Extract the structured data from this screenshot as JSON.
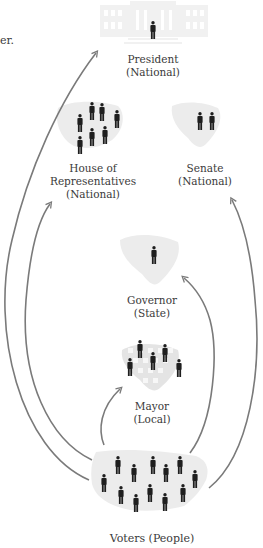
{
  "diagram": {
    "fragment_text": "er.",
    "nodes": {
      "president": {
        "title": "President",
        "scope": "(National)",
        "people": 1
      },
      "house": {
        "title_line1": "House of",
        "title_line2": "Representatives",
        "scope": "(National)",
        "people": 7
      },
      "senate": {
        "title": "Senate",
        "scope": "(National)",
        "people": 2
      },
      "governor": {
        "title": "Governor",
        "scope": "(State)",
        "people": 1
      },
      "mayor": {
        "title": "Mayor",
        "scope": "(Local)",
        "people": 5
      },
      "voters": {
        "title": "Voters (People)",
        "people": 14
      }
    },
    "edges": [
      {
        "from": "voters",
        "to": "president"
      },
      {
        "from": "voters",
        "to": "house"
      },
      {
        "from": "voters",
        "to": "senate"
      },
      {
        "from": "voters",
        "to": "governor"
      },
      {
        "from": "voters",
        "to": "mayor"
      }
    ],
    "colors": {
      "arrow": "#7a7a7a",
      "person": "#1e1e1e",
      "map_fill": "#ececec",
      "building_fill": "#f1f1f1",
      "text": "#3a3a3a"
    }
  }
}
